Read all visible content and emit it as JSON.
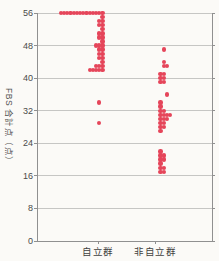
{
  "chart_data": {
    "type": "scatter",
    "subtype": "strip-dot-plot",
    "title": "",
    "ylabel": "FBS 合計点（点）",
    "xlabel": "",
    "ylim": [
      0,
      56
    ],
    "yticks": [
      0,
      8,
      16,
      24,
      32,
      40,
      48,
      56
    ],
    "grid": "horizontal",
    "legend": "none",
    "categories": [
      "自立群",
      "非自立群"
    ],
    "point_format": "[score, count, stack_start_offset]",
    "series": [
      {
        "name": "自立群",
        "stack_direction": "left",
        "n_points": 45,
        "points": [
          [
            56,
            14,
            0
          ],
          [
            55,
            1,
            0
          ],
          [
            54,
            2,
            0
          ],
          [
            53,
            2,
            0
          ],
          [
            52,
            1,
            0
          ],
          [
            51,
            2,
            0
          ],
          [
            50,
            2,
            0
          ],
          [
            49,
            1,
            0
          ],
          [
            48,
            3,
            0
          ],
          [
            47,
            2,
            0
          ],
          [
            46,
            2,
            0
          ],
          [
            45,
            2,
            0
          ],
          [
            44,
            1,
            0
          ],
          [
            43,
            3,
            0
          ],
          [
            42,
            5,
            0
          ],
          [
            34,
            1,
            1
          ],
          [
            29,
            1,
            1
          ]
        ]
      },
      {
        "name": "非自立群",
        "stack_direction": "right",
        "n_points": 37,
        "points": [
          [
            47,
            1,
            1
          ],
          [
            44,
            1,
            1
          ],
          [
            43,
            2,
            1
          ],
          [
            41,
            2,
            0
          ],
          [
            40,
            2,
            0
          ],
          [
            39,
            2,
            0
          ],
          [
            36,
            1,
            2
          ],
          [
            34,
            1,
            0
          ],
          [
            33,
            1,
            0
          ],
          [
            32,
            2,
            0
          ],
          [
            31,
            4,
            0
          ],
          [
            30,
            3,
            0
          ],
          [
            29,
            2,
            0
          ],
          [
            28,
            2,
            0
          ],
          [
            27,
            1,
            0
          ],
          [
            22,
            1,
            0
          ],
          [
            21,
            2,
            0
          ],
          [
            20,
            2,
            0
          ],
          [
            19,
            1,
            0
          ],
          [
            18,
            2,
            0
          ],
          [
            17,
            2,
            0
          ]
        ]
      }
    ]
  },
  "colors": {
    "dot": "#e5455a",
    "gridline": "#c6c6c4",
    "axis": "#909090",
    "tick_text": "#4a4a4a",
    "background": "#fbfaf7"
  }
}
